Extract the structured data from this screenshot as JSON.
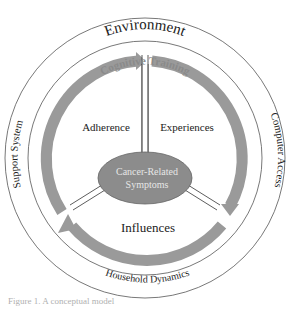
{
  "diagram": {
    "outer_ring_label_top": "Environment",
    "outer_ring_label_left": "Support System",
    "outer_ring_label_right": "Computer Access",
    "outer_ring_label_bottom": "Household Dynamics",
    "inner_ring_label_top": "Cognitive Training",
    "sector_labels": [
      "Adherence",
      "Experiences",
      "Influences"
    ],
    "center_label_line1": "Cancer-Related",
    "center_label_line2": "Symptoms",
    "colors": {
      "arrow": "#9a9a9a",
      "center_fill": "#8c8c8c",
      "center_text": "#e6e6e6",
      "cognitive_training_text": "#8a8a8a",
      "ring_stroke": "#555555",
      "text": "#222222"
    }
  },
  "caption": "Figure 1. A conceptual model"
}
